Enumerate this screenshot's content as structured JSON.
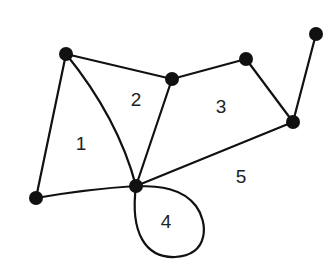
{
  "diagram": {
    "type": "planar-graph",
    "nodes": [
      {
        "id": "A",
        "x": 66,
        "y": 54
      },
      {
        "id": "B",
        "x": 172,
        "y": 79
      },
      {
        "id": "C",
        "x": 246,
        "y": 59
      },
      {
        "id": "D",
        "x": 316,
        "y": 34
      },
      {
        "id": "E",
        "x": 293,
        "y": 122
      },
      {
        "id": "F",
        "x": 36,
        "y": 198
      },
      {
        "id": "G",
        "x": 136,
        "y": 186
      }
    ],
    "edges": [
      {
        "from": "A",
        "to": "B"
      },
      {
        "from": "B",
        "to": "C"
      },
      {
        "from": "C",
        "to": "E"
      },
      {
        "from": "D",
        "to": "E"
      },
      {
        "from": "E",
        "to": "G"
      },
      {
        "from": "B",
        "to": "G"
      },
      {
        "from": "A",
        "to": "G",
        "curved": true
      },
      {
        "from": "A",
        "to": "F"
      },
      {
        "from": "F",
        "to": "G"
      },
      {
        "from": "G",
        "to": "G",
        "loop": true
      }
    ],
    "faces": [
      {
        "label": "1",
        "x": 81,
        "y": 145
      },
      {
        "label": "2",
        "x": 136,
        "y": 101
      },
      {
        "label": "3",
        "x": 221,
        "y": 108
      },
      {
        "label": "4",
        "x": 166,
        "y": 223
      },
      {
        "label": "5",
        "x": 241,
        "y": 178
      }
    ],
    "colors": {
      "stroke": "#111111",
      "node": "#111111",
      "background": "#ffffff"
    }
  }
}
